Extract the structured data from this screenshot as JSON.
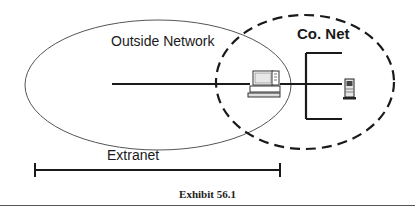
{
  "diagram": {
    "labels": {
      "outside_network": "Outside Network",
      "company_network": "Co. Net",
      "extranet": "Extranet"
    },
    "nodes": [
      {
        "id": "workstation",
        "icon": "computer-icon"
      },
      {
        "id": "server",
        "icon": "server-tower-icon"
      }
    ],
    "regions": [
      {
        "id": "outside-network",
        "style": "solid-ellipse"
      },
      {
        "id": "company-network",
        "style": "dashed-ellipse"
      }
    ],
    "span": {
      "id": "extranet-span",
      "label": "Extranet"
    },
    "caption": "Exhibit 56.1"
  },
  "colors": {
    "line": "#1a1a1a",
    "ellipse": "#555555",
    "background": "#ffffff"
  }
}
